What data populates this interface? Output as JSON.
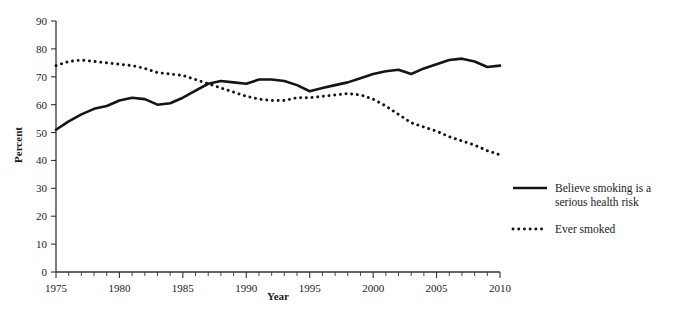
{
  "chart_data": {
    "type": "line",
    "title": "",
    "xlabel": "Year",
    "ylabel": "Percent",
    "xlim": [
      1975,
      2010
    ],
    "ylim": [
      0,
      90
    ],
    "ytick_step": 10,
    "xtick_step": 5,
    "xminor_step": 1,
    "grid": false,
    "legend_position": "right",
    "x": [
      1975,
      1976,
      1977,
      1978,
      1979,
      1980,
      1981,
      1982,
      1983,
      1984,
      1985,
      1986,
      1987,
      1988,
      1989,
      1990,
      1991,
      1992,
      1993,
      1994,
      1995,
      1996,
      1997,
      1998,
      1999,
      2000,
      2001,
      2002,
      2003,
      2004,
      2005,
      2006,
      2007,
      2008,
      2009,
      2010
    ],
    "series": [
      {
        "name": "Believe smoking is a serious health risk",
        "style": "solid",
        "color": "#141414",
        "values": [
          51,
          54,
          56.5,
          58.5,
          59.5,
          61.5,
          62.5,
          62,
          60,
          60.5,
          62.5,
          65,
          67.5,
          68.5,
          68,
          67.5,
          69,
          69,
          68.5,
          67,
          64.8,
          66,
          67,
          68,
          69.5,
          71,
          72,
          72.5,
          71,
          73,
          74.5,
          76,
          76.5,
          75.5,
          73.5,
          74
        ]
      },
      {
        "name": "Ever smoked",
        "style": "dotted",
        "color": "#141414",
        "values": [
          74,
          75.5,
          76,
          75.5,
          75,
          74.5,
          74,
          73,
          71.5,
          71,
          70.5,
          69,
          67.5,
          66,
          64.5,
          63,
          62,
          61.5,
          61.5,
          62.5,
          62.5,
          63,
          63.5,
          64,
          63.5,
          62,
          59.5,
          56.5,
          53.5,
          52,
          50.5,
          48.5,
          47,
          45.5,
          43.5,
          42
        ]
      }
    ],
    "xticks": [
      {
        "value": 1975,
        "label": "1975"
      },
      {
        "value": 1980,
        "label": "1980"
      },
      {
        "value": 1985,
        "label": "1985"
      },
      {
        "value": 1990,
        "label": "1990"
      },
      {
        "value": 1995,
        "label": "1995"
      },
      {
        "value": 2000,
        "label": "2000"
      },
      {
        "value": 2005,
        "label": "2005"
      },
      {
        "value": 2010,
        "label": "2010"
      }
    ],
    "yticks": [
      {
        "value": 0,
        "label": "0"
      },
      {
        "value": 10,
        "label": "10"
      },
      {
        "value": 20,
        "label": "20"
      },
      {
        "value": 30,
        "label": "30"
      },
      {
        "value": 40,
        "label": "40"
      },
      {
        "value": 50,
        "label": "50"
      },
      {
        "value": 60,
        "label": "60"
      },
      {
        "value": 70,
        "label": "70"
      },
      {
        "value": 80,
        "label": "80"
      },
      {
        "value": 90,
        "label": "90"
      }
    ],
    "legend": [
      {
        "label_line1": "Believe smoking is a",
        "label_line2": "serious health risk",
        "style": "solid"
      },
      {
        "label_line1": "Ever smoked",
        "label_line2": "",
        "style": "dotted"
      }
    ]
  }
}
